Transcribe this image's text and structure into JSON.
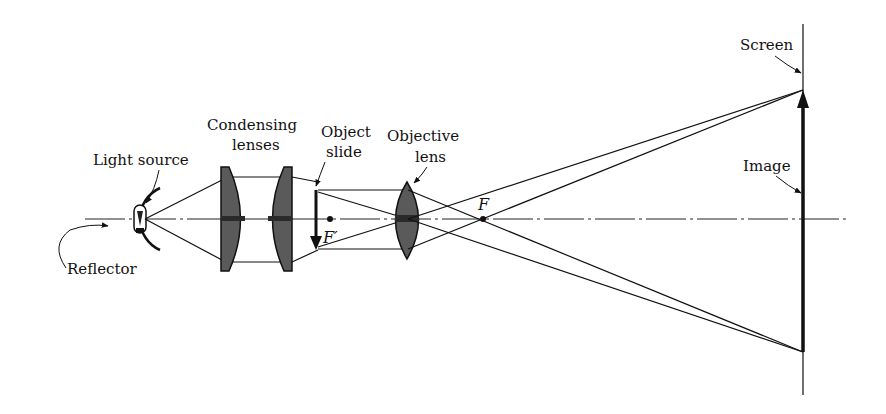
{
  "diagram": {
    "type": "optical-ray-diagram",
    "labels": {
      "light_source": "Light source",
      "reflector": "Reflector",
      "condensing_1": "Condensing",
      "condensing_2": "lenses",
      "object_1": "Object",
      "object_2": "slide",
      "objective_1": "Objective",
      "objective_2": "lens",
      "screen": "Screen",
      "image": "Image",
      "focal_point_object": "F′",
      "focal_point_image": "F"
    },
    "components": [
      {
        "name": "Reflector",
        "kind": "curved mirror"
      },
      {
        "name": "Light source",
        "kind": "lamp"
      },
      {
        "name": "Condensing lenses",
        "kind": "pair of plano-convex lenses"
      },
      {
        "name": "Object slide",
        "kind": "inverted object arrow"
      },
      {
        "name": "Objective lens",
        "kind": "biconvex lens"
      },
      {
        "name": "Screen",
        "kind": "vertical plane"
      },
      {
        "name": "Image",
        "kind": "upright enlarged image arrow"
      }
    ],
    "colors": {
      "ink": "#111111",
      "lens_fill": "#5a5a5a",
      "background": "#ffffff"
    }
  }
}
